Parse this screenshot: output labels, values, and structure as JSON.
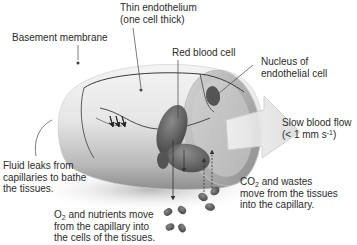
{
  "diagram": {
    "labels": {
      "thin_endothelium_line1": "Thin endothelium",
      "thin_endothelium_line2": "(one cell thick)",
      "basement_membrane": "Basement membrane",
      "red_blood_cell": "Red blood cell",
      "nucleus_line1": "Nucleus of",
      "nucleus_line2": "endothelial cell",
      "slow_flow_line1": "Slow blood flow",
      "slow_flow_line2_pre": "(< 1 mm s",
      "slow_flow_line2_sup": "-1",
      "slow_flow_line2_post": ")",
      "fluid_line1": "Fluid leaks from",
      "fluid_line2": "capillaries to bathe",
      "fluid_line3": "the tissues.",
      "co2_line1_pre": "CO",
      "co2_line1_sub": "2",
      "co2_line1_post": " and wastes",
      "co2_line2": "move from the tissues",
      "co2_line3": "into the capillary.",
      "o2_line1_pre": "O",
      "o2_line1_sub": "2",
      "o2_line1_post": " and nutrients move",
      "o2_line2": "from the capillary into",
      "o2_line3": "the cells of the tissues."
    },
    "colors": {
      "tube_light": "#ebebeb",
      "tube_shadow": "#9a9a9a",
      "cell_dark": "#5a5a5a",
      "text": "#2b2b2b",
      "flow_arrow": "#e0e0e0"
    }
  }
}
